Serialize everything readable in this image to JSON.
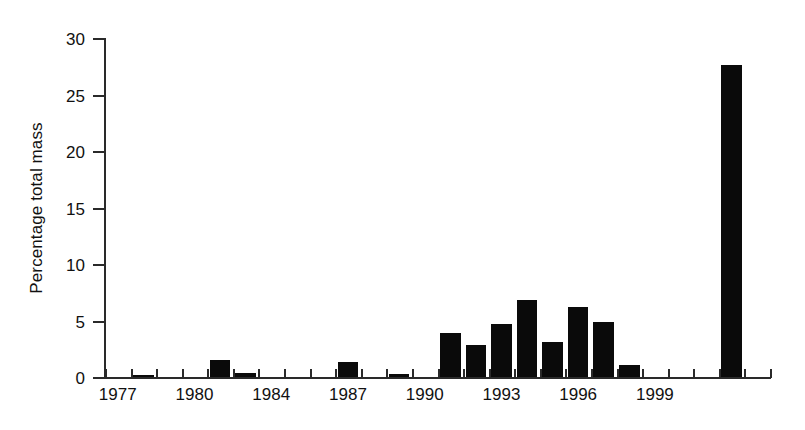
{
  "chart_data": {
    "type": "bar",
    "title": "",
    "subtitle": "",
    "xlabel": "",
    "ylabel": "Percentage total mass",
    "ylim": [
      0,
      30
    ],
    "yticks": [
      0,
      5,
      10,
      15,
      20,
      25,
      30
    ],
    "ytick_labels": [
      "0",
      "5",
      "10",
      "15",
      "20",
      "25",
      "30"
    ],
    "xlim": [
      1977,
      2003
    ],
    "xtick_labels": [
      "1977",
      "1980",
      "1984",
      "1987",
      "1990",
      "1993",
      "1996",
      "1999"
    ],
    "xtick_label_years": [
      1977,
      1980,
      1983,
      1986,
      1989,
      1992,
      1995,
      1998
    ],
    "grid": false,
    "legend": null,
    "bar_color": "#0a0a0a",
    "axis_color": "#2a2a2a",
    "categories": [
      1977,
      1978,
      1979,
      1980,
      1981,
      1982,
      1983,
      1984,
      1985,
      1986,
      1987,
      1988,
      1989,
      1990,
      1991,
      1992,
      1993,
      1994,
      1995,
      1996,
      1997,
      1998,
      1999,
      2000,
      2001,
      2002
    ],
    "values": [
      0,
      0.2,
      0,
      0,
      1.5,
      0.35,
      0,
      0,
      0,
      1.3,
      0,
      0.3,
      0,
      3.9,
      2.8,
      4.7,
      6.8,
      3.1,
      6.2,
      4.9,
      1.1,
      0,
      0,
      0,
      27.6,
      0
    ],
    "units": "percent"
  },
  "figure": {
    "name": "percentage-total-mass-by-year"
  }
}
